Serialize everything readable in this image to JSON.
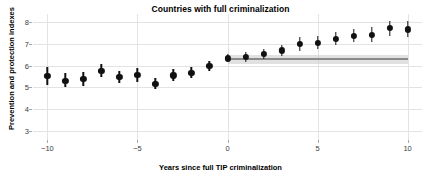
{
  "chart_data": {
    "type": "scatter",
    "title": "Countries with full criminalization",
    "xlabel": "Years since full TIP criminalization",
    "ylabel": "Prevention and protection indexes",
    "xlim": [
      -10.8,
      10.8
    ],
    "ylim": [
      2.6,
      8.35
    ],
    "grid": true,
    "legend": null,
    "xticks": [
      -10,
      -5,
      0,
      5,
      10
    ],
    "xtick_labels": [
      "−10",
      "−5",
      "0",
      "5",
      "10"
    ],
    "yticks": [
      3,
      4,
      5,
      6,
      7,
      8
    ],
    "ytick_labels": [
      "3",
      "4",
      "5",
      "6",
      "7",
      "8"
    ],
    "series": [
      {
        "name": "Point estimate with 95% CI",
        "marker": "filled-circle",
        "color": "#111111",
        "x": [
          -10,
          -9,
          -8,
          -7,
          -6,
          -5,
          -4,
          -3,
          -2,
          -1,
          0,
          1,
          2,
          3,
          4,
          5,
          6,
          7,
          8,
          9,
          10
        ],
        "values": [
          5.52,
          5.31,
          5.38,
          5.75,
          5.47,
          5.57,
          5.17,
          5.55,
          5.68,
          5.97,
          6.32,
          6.38,
          6.53,
          6.69,
          6.98,
          7.03,
          7.22,
          7.35,
          7.41,
          7.7,
          7.65
        ],
        "ci_low": [
          5.12,
          5.0,
          5.06,
          5.46,
          5.21,
          5.26,
          4.92,
          5.28,
          5.42,
          5.76,
          6.14,
          6.17,
          6.3,
          6.44,
          6.68,
          6.73,
          6.93,
          7.05,
          7.09,
          7.35,
          7.28
        ],
        "ci_high": [
          5.94,
          5.64,
          5.72,
          6.05,
          5.76,
          5.89,
          5.44,
          5.84,
          5.95,
          6.19,
          6.51,
          6.6,
          6.77,
          6.94,
          7.29,
          7.34,
          7.52,
          7.65,
          7.74,
          8.05,
          8.01
        ]
      }
    ],
    "reference_band": {
      "name": "Post-treatment counterfactual mean",
      "x_start": 0,
      "x_end": 10,
      "value": 6.3,
      "band_low": 6.07,
      "band_high": 6.47,
      "line_color": "#8a8a8a",
      "band_color": "#c9c9c9"
    },
    "annotations": []
  },
  "colors": {
    "background": "#ffffff",
    "grid": "#e3e3e3",
    "marker": "#111111",
    "band": "#c9c9c9",
    "reference_line": "#8a8a8a",
    "axis_text": "#3b3b3b",
    "title_text": "#000000"
  }
}
